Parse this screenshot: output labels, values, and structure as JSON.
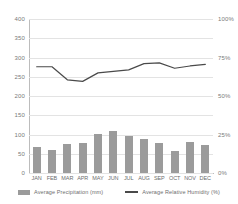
{
  "chart_data": {
    "type": "bar",
    "title": "",
    "subtitle": "",
    "xlabel": "",
    "ylabel": "",
    "categories": [
      "JAN",
      "FEB",
      "MAR",
      "APR",
      "MAY",
      "JUN",
      "JUL",
      "AUG",
      "SEP",
      "OCT",
      "NOV",
      "DEC"
    ],
    "series": [
      {
        "name": "Average Precipitation (mm)",
        "type": "bar",
        "axis": "left",
        "color": "#9b9b9b",
        "values": [
          68,
          61,
          75,
          79,
          101,
          108,
          96,
          89,
          79,
          57,
          80,
          72
        ]
      },
      {
        "name": "Average Relative Humidity (%)",
        "type": "line",
        "axis": "right",
        "color": "#4a4a4a",
        "values": [
          69,
          69,
          60.5,
          59.5,
          65,
          66,
          67,
          71,
          71.5,
          68,
          69.5,
          70.5
        ]
      }
    ],
    "left_axis": {
      "ticks": [
        "0",
        "50",
        "100",
        "150",
        "200",
        "250",
        "300",
        "350",
        "400"
      ],
      "values": [
        0,
        50,
        100,
        150,
        200,
        250,
        300,
        350,
        400
      ],
      "ylim": [
        0,
        400
      ]
    },
    "right_axis": {
      "ticks": [
        "0%",
        "25%",
        "50%",
        "75%",
        "100%"
      ],
      "values": [
        0,
        25,
        50,
        75,
        100
      ],
      "ylim": [
        0,
        100
      ]
    },
    "grid": true,
    "legend_position": "bottom"
  },
  "legend": {
    "items": [
      {
        "label": "Average Precipitation (mm)",
        "marker": "bar-swatch-icon"
      },
      {
        "label": "Average Relative Humidity (%)",
        "marker": "line-swatch-icon"
      }
    ]
  }
}
